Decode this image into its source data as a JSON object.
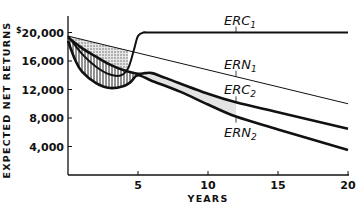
{
  "chart_data": {
    "type": "line",
    "title": "",
    "xlabel": "YEARS",
    "ylabel": "EXPECTED NET RETURNS",
    "xlim": [
      0,
      20
    ],
    "ylim": [
      0,
      21500
    ],
    "grid": false,
    "x_ticks": [
      5,
      10,
      15,
      20
    ],
    "x_tick_labels": [
      "5",
      "10",
      "15",
      "20"
    ],
    "y_ticks": [
      4000,
      8000,
      12000,
      16000,
      20000
    ],
    "y_tick_labels": [
      "4,000",
      "8,000",
      "12,000",
      "16,000",
      "$20,000"
    ],
    "series": [
      {
        "name": "ERC",
        "subscript": "1",
        "x": [
          0,
          1,
          2,
          3,
          3.8,
          4.3,
          4.7,
          5,
          5.4,
          6,
          10,
          15,
          20
        ],
        "values": [
          19500,
          17000,
          15200,
          14100,
          14000,
          15000,
          17500,
          19500,
          20000,
          20000,
          20000,
          20000,
          20000
        ],
        "label_x": 12
      },
      {
        "name": "ERN",
        "subscript": "1",
        "x": [
          0,
          20
        ],
        "values": [
          19500,
          10000
        ],
        "label_x": 12
      },
      {
        "name": "ERC",
        "subscript": "2",
        "x": [
          0,
          1,
          2,
          3,
          4,
          5,
          5.5,
          6,
          7,
          10,
          12,
          15,
          20
        ],
        "values": [
          19300,
          17800,
          16600,
          15500,
          14700,
          14200,
          14300,
          14300,
          13600,
          11400,
          10200,
          8800,
          6500
        ],
        "label_x": 12
      },
      {
        "name": "ERN",
        "subscript": "2",
        "x": [
          0,
          0.5,
          1,
          2,
          3,
          4,
          4.5,
          5,
          6,
          8,
          10,
          12,
          15,
          20
        ],
        "values": [
          18800,
          16200,
          14500,
          12900,
          12200,
          12500,
          13100,
          14000,
          13200,
          11700,
          9900,
          8200,
          6400,
          3500
        ],
        "label_x": 12
      }
    ],
    "shaded_regions": [
      {
        "between": [
          "ERN1",
          "ERC1"
        ],
        "x_range": [
          0,
          4.3
        ],
        "pattern": "dotted"
      },
      {
        "between": [
          "ERC2",
          "ERN2"
        ],
        "x_range": [
          0,
          5
        ],
        "pattern": "vertical-hatch"
      },
      {
        "between": [
          "ERC2",
          "ERN2"
        ],
        "x_range": [
          5.5,
          12
        ],
        "pattern": "light-gray"
      }
    ]
  }
}
